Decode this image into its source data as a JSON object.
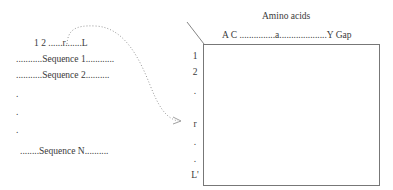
{
  "alignment": {
    "position_header": "1 2 ......r.......L",
    "sequences": [
      "...........Sequence 1............",
      "...........Sequence 2..........",
      ".",
      ".",
      ".",
      "........Sequence N.........."
    ]
  },
  "matrix": {
    "column_title": "Amino acids",
    "column_header": "A C ...............a....................Y  Gap",
    "row_labels": [
      "1",
      "2",
      ".",
      "r",
      ".",
      ".",
      "L'"
    ]
  },
  "arrow": {
    "from": "position r",
    "to": "row r",
    "style": "dotted"
  }
}
